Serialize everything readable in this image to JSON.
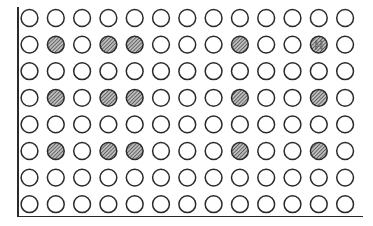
{
  "plate": {
    "rows": 8,
    "columns": 13,
    "well_marker_label": "H",
    "marked_well": {
      "row": 2,
      "column": 12
    },
    "shaded_wells": [
      {
        "row": 2,
        "column": 2
      },
      {
        "row": 2,
        "column": 4
      },
      {
        "row": 2,
        "column": 5
      },
      {
        "row": 2,
        "column": 9
      },
      {
        "row": 2,
        "column": 12
      },
      {
        "row": 4,
        "column": 2
      },
      {
        "row": 4,
        "column": 4
      },
      {
        "row": 4,
        "column": 5
      },
      {
        "row": 4,
        "column": 9
      },
      {
        "row": 4,
        "column": 12
      },
      {
        "row": 6,
        "column": 2
      },
      {
        "row": 6,
        "column": 4
      },
      {
        "row": 6,
        "column": 5
      },
      {
        "row": 6,
        "column": 9
      },
      {
        "row": 6,
        "column": 12
      }
    ],
    "colors": {
      "outline": "#2a2a2a",
      "hatch": "#3a3a3a",
      "background": "#ffffff"
    }
  }
}
